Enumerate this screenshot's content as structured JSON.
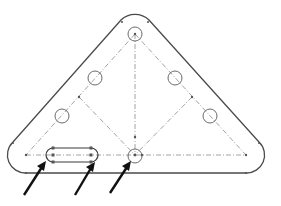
{
  "diagram": {
    "title": "",
    "colors": {
      "outline": "#4a4a4a",
      "construction": "#8a8a8a",
      "arrow": "#111111",
      "background": "#ffffff"
    },
    "outline": {
      "top_corner": {
        "cx": 135,
        "cy": 34,
        "r": 20
      },
      "left_corner": {
        "cx": 26,
        "cy": 155,
        "r": 18
      },
      "right_corner": {
        "cx": 246,
        "cy": 155,
        "r": 18
      }
    },
    "construction_triangle": {
      "apex": [
        135,
        34
      ],
      "base_left": [
        26,
        155
      ],
      "base_right": [
        246,
        155
      ],
      "base_mid": [
        135,
        155
      ],
      "left_mid": [
        79,
        97
      ],
      "right_mid": [
        192,
        97
      ]
    },
    "holes": [
      {
        "name": "top-hole",
        "cx": 135,
        "cy": 34,
        "r": 7
      },
      {
        "name": "left-upper-hole",
        "cx": 95,
        "cy": 78,
        "r": 7
      },
      {
        "name": "left-lower-hole",
        "cx": 62,
        "cy": 116,
        "r": 7
      },
      {
        "name": "right-upper-hole",
        "cx": 175,
        "cy": 78,
        "r": 7
      },
      {
        "name": "right-lower-hole",
        "cx": 210,
        "cy": 116,
        "r": 7
      },
      {
        "name": "center-hole",
        "cx": 135,
        "cy": 155,
        "r": 7
      }
    ],
    "slot": {
      "x1": 53,
      "x2": 91,
      "cy": 155,
      "r": 7
    },
    "arrows": [
      {
        "name": "arrow-slot-left",
        "from": [
          24,
          195
        ],
        "to": [
          46,
          161
        ]
      },
      {
        "name": "arrow-slot-right",
        "from": [
          75,
          195
        ],
        "to": [
          95,
          162
        ]
      },
      {
        "name": "arrow-center-hole",
        "from": [
          110,
          193
        ],
        "to": [
          131,
          161
        ]
      }
    ]
  }
}
